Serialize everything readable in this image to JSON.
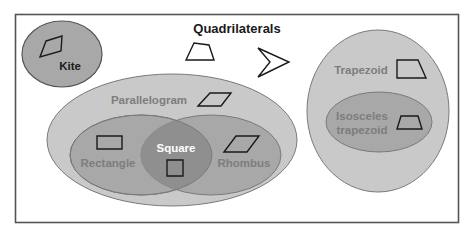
{
  "title": "Quadrilaterals",
  "colors": {
    "frame": "#555555",
    "outer_fill": "#c9c9c9",
    "middle_fill": "#a8a8a8",
    "inner_fill": "#8f8f8f",
    "ellipse_stroke": "#7a7a7a",
    "label_dark": "#1a1a1a",
    "label_gray": "#7d7d7d",
    "label_white": "#ffffff"
  },
  "sets": {
    "kite": {
      "label": "Kite"
    },
    "parallelogram": {
      "label": "Parallelogram"
    },
    "rectangle": {
      "label": "Rectangle"
    },
    "rhombus": {
      "label": "Rhombus"
    },
    "square": {
      "label": "Square"
    },
    "trapezoid": {
      "label": "Trapezoid"
    },
    "isosceles_trapezoid": {
      "label_line1": "Isosceles",
      "label_line2": "trapezoid"
    }
  },
  "free_shapes": [
    "generic-quadrilateral",
    "dart"
  ]
}
